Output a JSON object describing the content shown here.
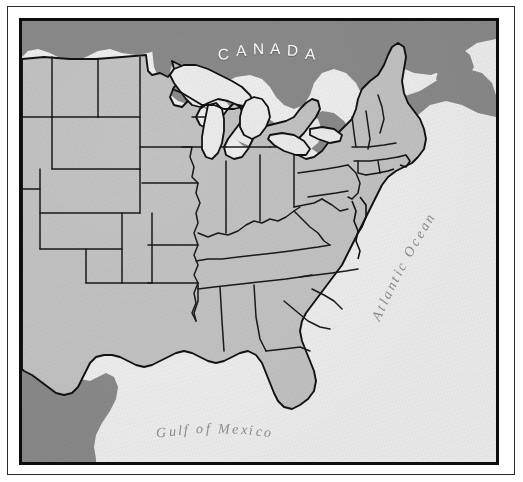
{
  "document": {
    "kind": "reference-map",
    "title": "Eastern United States outline map"
  },
  "frame": {
    "outer_rule": "thin-black-rule",
    "map_border": "thick-black-border"
  },
  "map": {
    "colors": {
      "us_land": "#c3c3c3",
      "foreign_land": "#8a8a8a",
      "water": "#efefef",
      "lakes": "#ececec",
      "outline": "#111111",
      "state_border": "#1a1a1a",
      "label_light": "#fdfdfd",
      "label_gray": "#8d8d8d"
    },
    "labels": [
      {
        "id": "canada",
        "text": "CANADA",
        "style": "uppercase-spaced-white"
      },
      {
        "id": "gulf_of_mexico",
        "text": "Gulf of Mexico",
        "style": "italic-serif-gray"
      },
      {
        "id": "atlantic_ocean",
        "text": "Atlantic Ocean",
        "style": "italic-serif-gray-rotated"
      }
    ],
    "regions": [
      {
        "name": "Canada",
        "fill": "foreign_land"
      },
      {
        "name": "Mexico",
        "fill": "foreign_land"
      },
      {
        "name": "United States",
        "fill": "us_land"
      },
      {
        "name": "Great Lakes",
        "fill": "lakes"
      },
      {
        "name": "Atlantic Ocean",
        "fill": "water"
      },
      {
        "name": "Gulf of Mexico",
        "fill": "water"
      }
    ],
    "features": [
      "Great Lakes",
      "Florida peninsula",
      "Chesapeake Bay",
      "Delmarva Peninsula",
      "Cape Cod",
      "Long Island",
      "Gulf of St. Lawrence",
      "Nova Scotia",
      "Mississippi Delta"
    ]
  }
}
